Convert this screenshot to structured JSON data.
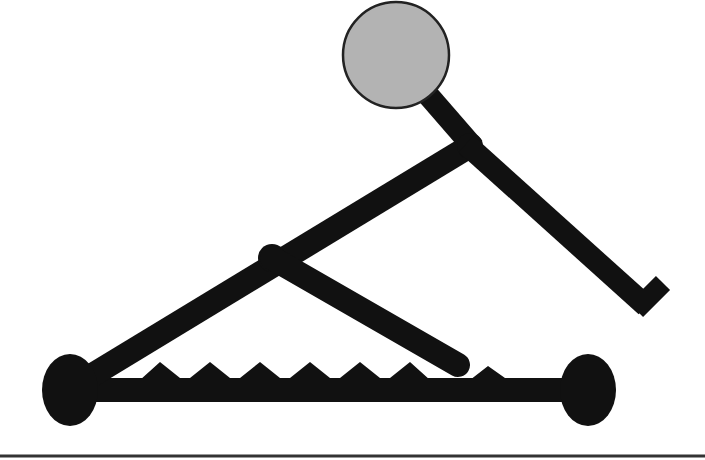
{
  "diagram": {
    "title": "Rowing stick figure on sliding seat apparatus",
    "colors": {
      "background": "#ffffff",
      "stroke": "#111111",
      "head_fill": "#b3b3b3",
      "head_stroke": "#222222",
      "rule": "#333333"
    },
    "elements": {
      "head": {
        "cx": 396,
        "cy": 55,
        "r": 53
      },
      "left_wheel": {
        "cx": 70,
        "cy": 390,
        "rx": 28,
        "ry": 36
      },
      "right_wheel": {
        "cx": 588,
        "cy": 390,
        "rx": 28,
        "ry": 36
      },
      "base_bar": {
        "x1": 70,
        "y1": 390,
        "x2": 588,
        "y2": 390,
        "width": 24
      },
      "long_arm": {
        "x1": 76,
        "y1": 385,
        "x2": 470,
        "y2": 145,
        "width": 24
      },
      "middle_joint": {
        "x": 272,
        "y": 258
      },
      "strut": {
        "x1": 272,
        "y1": 258,
        "x2": 460,
        "y2": 366,
        "width": 24
      },
      "neck": {
        "x1": 428,
        "y1": 95,
        "x2": 472,
        "y2": 148,
        "width": 22
      },
      "leg": {
        "x1": 468,
        "y1": 145,
        "x2": 645,
        "y2": 304,
        "width": 22
      },
      "foot": {
        "x1": 638,
        "y1": 308,
        "x2": 662,
        "y2": 283,
        "width": 20
      },
      "rule_y": 456
    },
    "sawtooth": {
      "baseline_y": 378,
      "peak_y": 361,
      "teeth_x": [
        160,
        210,
        260,
        310,
        360,
        410,
        488
      ]
    }
  }
}
